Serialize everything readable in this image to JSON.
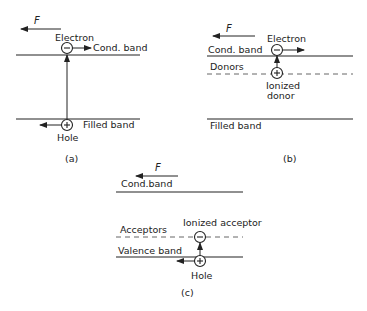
{
  "panels": [
    {
      "id": "a",
      "caption": "(a)",
      "force_label": "F",
      "labels": {
        "electron": "Electron",
        "upper_band": "Cond. band",
        "lower_band": "Filled band",
        "hole": "Hole"
      },
      "charges": {
        "electron": "−",
        "hole": "+"
      }
    },
    {
      "id": "b",
      "caption": "(b)",
      "force_label": "F",
      "labels": {
        "electron": "Electron",
        "upper_band": "Cond. band",
        "impurity_level": "Donors",
        "ionized_line1": "Ionized",
        "ionized_line2": "donor",
        "lower_band": "Filled band"
      },
      "charges": {
        "electron": "−",
        "ionized_donor": "+"
      }
    },
    {
      "id": "c",
      "caption": "(c)",
      "force_label": "F",
      "labels": {
        "upper_band": "Cond.band",
        "ionized": "Ionized acceptor",
        "impurity_level": "Acceptors",
        "lower_band": "Valence band",
        "hole": "Hole"
      },
      "charges": {
        "ionized_acceptor": "−",
        "hole": "+"
      }
    }
  ],
  "colors": {
    "ink": "#222222",
    "dashed": "#666666",
    "background": "#ffffff"
  }
}
